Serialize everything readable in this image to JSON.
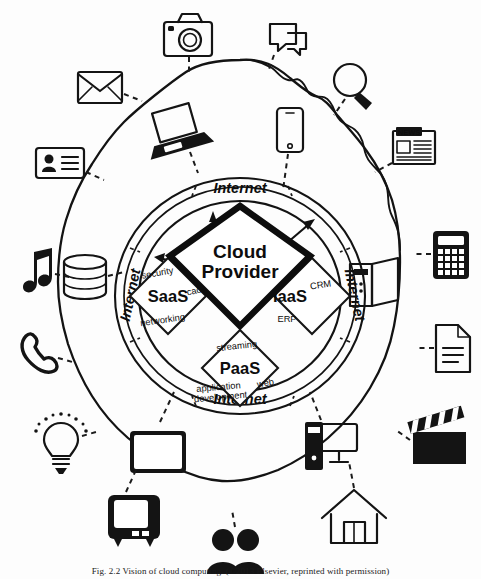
{
  "figure": {
    "caption": "Fig. 2.2  Vision of cloud computing. (©2013 Elsevier, reprinted with permission)"
  },
  "center": {
    "cloud_provider_line1": "Cloud",
    "cloud_provider_line2": "Provider"
  },
  "ring_labels": {
    "top": "Internet",
    "bottom": "Internet",
    "left": "Internet",
    "right": "Internet"
  },
  "services": [
    {
      "id": "saas",
      "name": "SaaS",
      "tags": [
        "security",
        "caching",
        "networking"
      ]
    },
    {
      "id": "iaas",
      "name": "IaaS",
      "tags": [
        "e-mail",
        "CRM",
        "ERP"
      ]
    },
    {
      "id": "paas",
      "name": "PaaS",
      "tags": [
        "streaming",
        "application development",
        "web"
      ]
    }
  ],
  "outer_icons": [
    {
      "id": "camera",
      "icon": "camera-icon",
      "label": "Camera"
    },
    {
      "id": "chat",
      "icon": "chat-bubbles-icon",
      "label": "Chat"
    },
    {
      "id": "envelope",
      "icon": "envelope-icon",
      "label": "E-mail"
    },
    {
      "id": "search",
      "icon": "magnifier-icon",
      "label": "Search"
    },
    {
      "id": "laptop",
      "icon": "laptop-icon",
      "label": "Laptop"
    },
    {
      "id": "smartphone",
      "icon": "smartphone-icon",
      "label": "Smartphone"
    },
    {
      "id": "news",
      "icon": "newspaper-icon",
      "label": "NEWS"
    },
    {
      "id": "idcard",
      "icon": "id-card-icon",
      "label": "ID card"
    },
    {
      "id": "calculator",
      "icon": "calculator-icon",
      "label": "Calculator"
    },
    {
      "id": "music",
      "icon": "music-note-icon",
      "label": "Music"
    },
    {
      "id": "database",
      "icon": "database-icon",
      "label": "Database"
    },
    {
      "id": "server",
      "icon": "server-tower-icon",
      "label": "Server"
    },
    {
      "id": "document",
      "icon": "document-icon",
      "label": "Document"
    },
    {
      "id": "phone",
      "icon": "phone-handset-icon",
      "label": "Telephone"
    },
    {
      "id": "bulb",
      "icon": "lightbulb-icon",
      "label": "Idea"
    },
    {
      "id": "tablet",
      "icon": "tablet-icon",
      "label": "Tablet"
    },
    {
      "id": "desktop",
      "icon": "desktop-pc-icon",
      "label": "Desktop PC"
    },
    {
      "id": "clapper",
      "icon": "clapperboard-icon",
      "label": "Video"
    },
    {
      "id": "tv",
      "icon": "television-icon",
      "label": "Television"
    },
    {
      "id": "people",
      "icon": "people-icon",
      "label": "Users"
    },
    {
      "id": "house",
      "icon": "house-icon",
      "label": "Home"
    }
  ],
  "news_label": "NEWS",
  "colors": {
    "ink": "#131313",
    "background": "#ffffff"
  }
}
